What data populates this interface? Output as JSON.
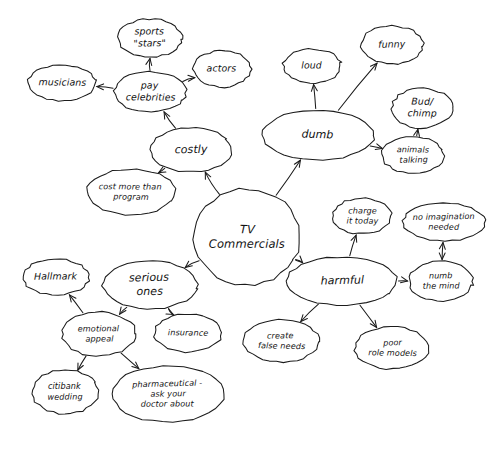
{
  "diagram": {
    "style": "hand-drawn ellipses with arrows",
    "background_color": "#ffffff",
    "ink_color": "#1b1b1b",
    "canvas": {
      "width": 493,
      "height": 452
    }
  },
  "nodes": [
    {
      "id": "tv-commercials",
      "label_lines": [
        "TV",
        "Commercials"
      ],
      "label": "TV Commercials",
      "cx": 247,
      "cy": 237,
      "rx": 53,
      "ry": 48,
      "size": "center"
    },
    {
      "id": "costly",
      "label_lines": [
        "costly"
      ],
      "label": "costly",
      "cx": 191,
      "cy": 150,
      "rx": 41,
      "ry": 22,
      "size": "major"
    },
    {
      "id": "dumb",
      "label_lines": [
        "dumb"
      ],
      "label": "dumb",
      "cx": 318,
      "cy": 135,
      "rx": 56,
      "ry": 25,
      "size": "major"
    },
    {
      "id": "serious-ones",
      "label_lines": [
        "serious",
        "ones"
      ],
      "label": "serious ones",
      "cx": 150,
      "cy": 285,
      "rx": 47,
      "ry": 24,
      "size": "major"
    },
    {
      "id": "harmful",
      "label_lines": [
        "harmful"
      ],
      "label": "harmful",
      "cx": 342,
      "cy": 281,
      "rx": 55,
      "ry": 24,
      "size": "major"
    },
    {
      "id": "pay-celebrities",
      "label_lines": [
        "pay",
        "celebrities"
      ],
      "label": "pay celebrities",
      "cx": 150,
      "cy": 92,
      "rx": 36,
      "ry": 20,
      "size": "minor"
    },
    {
      "id": "sports-stars",
      "label_lines": [
        "sports",
        "\"stars\""
      ],
      "label": "sports \"stars\"",
      "cx": 150,
      "cy": 38,
      "rx": 32,
      "ry": 19,
      "size": "minor"
    },
    {
      "id": "musicians",
      "label_lines": [
        "musicians"
      ],
      "label": "musicians",
      "cx": 62,
      "cy": 83,
      "rx": 34,
      "ry": 18,
      "size": "minor"
    },
    {
      "id": "actors",
      "label_lines": [
        "actors"
      ],
      "label": "actors",
      "cx": 222,
      "cy": 69,
      "rx": 29,
      "ry": 18,
      "size": "minor"
    },
    {
      "id": "cost-more-than-program",
      "label_lines": [
        "cost more than",
        "program"
      ],
      "label": "cost more than program",
      "cx": 131,
      "cy": 192,
      "rx": 44,
      "ry": 23,
      "size": "tiny"
    },
    {
      "id": "loud",
      "label_lines": [
        "loud"
      ],
      "label": "loud",
      "cx": 312,
      "cy": 66,
      "rx": 29,
      "ry": 17,
      "size": "minor"
    },
    {
      "id": "funny",
      "label_lines": [
        "funny"
      ],
      "label": "funny",
      "cx": 392,
      "cy": 45,
      "rx": 31,
      "ry": 19,
      "size": "minor"
    },
    {
      "id": "bud-chimp",
      "label_lines": [
        "Bud/",
        "chimp"
      ],
      "label": "Bud/ chimp",
      "cx": 422,
      "cy": 108,
      "rx": 30,
      "ry": 20,
      "size": "minor"
    },
    {
      "id": "animals-talking",
      "label_lines": [
        "animals",
        "talking"
      ],
      "label": "animals talking",
      "cx": 413,
      "cy": 155,
      "rx": 31,
      "ry": 18,
      "size": "tiny"
    },
    {
      "id": "charge-it-today",
      "label_lines": [
        "charge",
        "it today"
      ],
      "label": "charge it today",
      "cx": 362,
      "cy": 216,
      "rx": 29,
      "ry": 18,
      "size": "tiny"
    },
    {
      "id": "no-imagination-needed",
      "label_lines": [
        "no imagination",
        "needed"
      ],
      "label": "no imagination needed",
      "cx": 444,
      "cy": 222,
      "rx": 41,
      "ry": 19,
      "size": "tiny"
    },
    {
      "id": "numb-the-mind",
      "label_lines": [
        "numb",
        "the mind"
      ],
      "label": "numb the mind",
      "cx": 441,
      "cy": 281,
      "rx": 32,
      "ry": 20,
      "size": "tiny"
    },
    {
      "id": "create-false-needs",
      "label_lines": [
        "create",
        "false needs"
      ],
      "label": "create false needs",
      "cx": 281,
      "cy": 341,
      "rx": 38,
      "ry": 21,
      "size": "tiny"
    },
    {
      "id": "poor-role-models",
      "label_lines": [
        "poor",
        "role models"
      ],
      "label": "poor role models",
      "cx": 392,
      "cy": 348,
      "rx": 37,
      "ry": 21,
      "size": "tiny"
    },
    {
      "id": "hallmark",
      "label_lines": [
        "Hallmark"
      ],
      "label": "Hallmark",
      "cx": 56,
      "cy": 277,
      "rx": 33,
      "ry": 18,
      "size": "minor"
    },
    {
      "id": "insurance",
      "label_lines": [
        "insurance"
      ],
      "label": "insurance",
      "cx": 188,
      "cy": 333,
      "rx": 34,
      "ry": 19,
      "size": "tiny"
    },
    {
      "id": "emotional-appeal",
      "label_lines": [
        "emotional",
        "appeal"
      ],
      "label": "emotional appeal",
      "cx": 99,
      "cy": 334,
      "rx": 37,
      "ry": 22,
      "size": "tiny"
    },
    {
      "id": "citibank-wedding",
      "label_lines": [
        "citibank",
        "wedding"
      ],
      "label": "citibank wedding",
      "cx": 65,
      "cy": 392,
      "rx": 33,
      "ry": 22,
      "size": "tiny"
    },
    {
      "id": "pharmaceutical",
      "label_lines": [
        "pharmaceutical -",
        "ask your",
        "doctor about"
      ],
      "label": "pharmaceutical - ask your doctor about",
      "cx": 168,
      "cy": 394,
      "rx": 56,
      "ry": 28,
      "size": "tiny"
    }
  ],
  "edges": [
    {
      "from": "tv-commercials",
      "to": "costly",
      "arrow": "end"
    },
    {
      "from": "tv-commercials",
      "to": "dumb",
      "arrow": "end"
    },
    {
      "from": "tv-commercials",
      "to": "serious-ones",
      "arrow": "end"
    },
    {
      "from": "tv-commercials",
      "to": "harmful",
      "arrow": "end"
    },
    {
      "from": "costly",
      "to": "pay-celebrities",
      "arrow": "end"
    },
    {
      "from": "costly",
      "to": "cost-more-than-program",
      "arrow": "end"
    },
    {
      "from": "pay-celebrities",
      "to": "sports-stars",
      "arrow": "end"
    },
    {
      "from": "pay-celebrities",
      "to": "musicians",
      "arrow": "end"
    },
    {
      "from": "pay-celebrities",
      "to": "actors",
      "arrow": "end"
    },
    {
      "from": "dumb",
      "to": "loud",
      "arrow": "end"
    },
    {
      "from": "dumb",
      "to": "funny",
      "arrow": "end"
    },
    {
      "from": "dumb",
      "to": "animals-talking",
      "arrow": "end"
    },
    {
      "from": "animals-talking",
      "to": "bud-chimp",
      "arrow": "end"
    },
    {
      "from": "harmful",
      "to": "charge-it-today",
      "arrow": "end"
    },
    {
      "from": "harmful",
      "to": "numb-the-mind",
      "arrow": "end"
    },
    {
      "from": "harmful",
      "to": "create-false-needs",
      "arrow": "end"
    },
    {
      "from": "harmful",
      "to": "poor-role-models",
      "arrow": "end"
    },
    {
      "from": "numb-the-mind",
      "to": "no-imagination-needed",
      "arrow": "both"
    },
    {
      "from": "serious-ones",
      "to": "emotional-appeal",
      "arrow": "end"
    },
    {
      "from": "serious-ones",
      "to": "insurance",
      "arrow": "end"
    },
    {
      "from": "emotional-appeal",
      "to": "hallmark",
      "arrow": "end"
    },
    {
      "from": "emotional-appeal",
      "to": "citibank-wedding",
      "arrow": "end"
    },
    {
      "from": "emotional-appeal",
      "to": "pharmaceutical",
      "arrow": "end"
    }
  ]
}
